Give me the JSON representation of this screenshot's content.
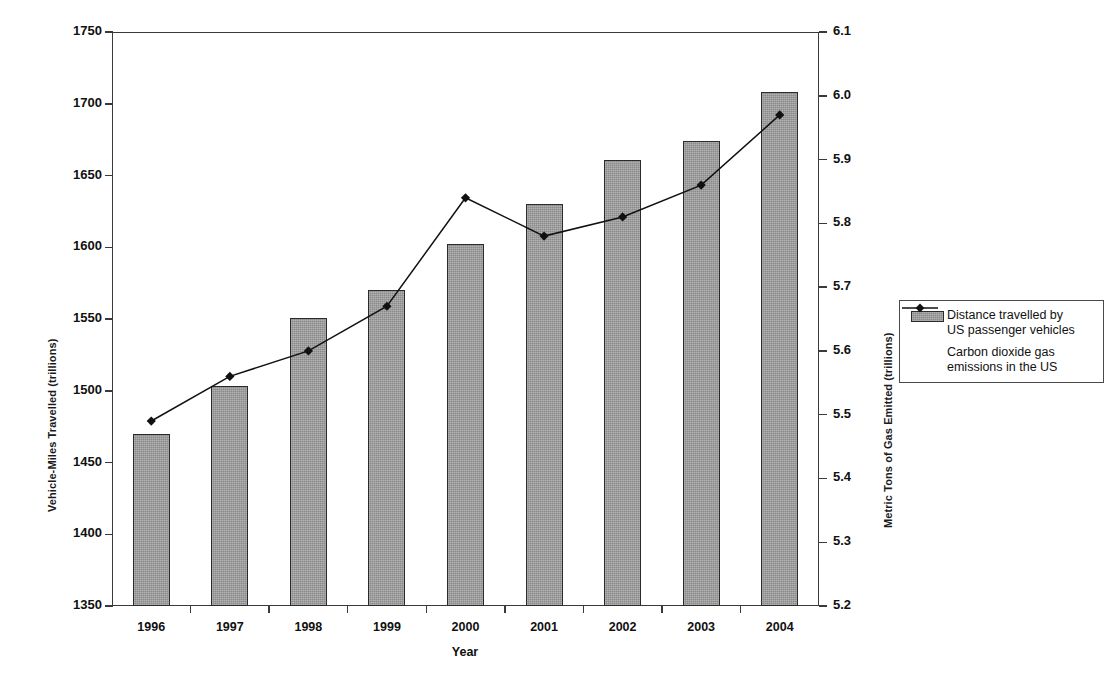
{
  "chart_data": {
    "type": "bar",
    "title": "",
    "xlabel": "Year",
    "categories": [
      "1996",
      "1997",
      "1998",
      "1999",
      "2000",
      "2001",
      "2002",
      "2003",
      "2004"
    ],
    "grid": false,
    "legend_position": "right",
    "axes": {
      "left": {
        "label": "Vehicle-Miles Travelled (trillions)",
        "min": 1350,
        "max": 1750,
        "step": 50,
        "ticks": [
          "1350",
          "1400",
          "1450",
          "1500",
          "1550",
          "1600",
          "1650",
          "1700",
          "1750"
        ]
      },
      "right": {
        "label": "Metric Tons of Gas Emitted (trillions)",
        "min": 5.2,
        "max": 6.1,
        "step": 0.1,
        "ticks": [
          "5.2",
          "5.3",
          "5.4",
          "5.5",
          "5.6",
          "5.7",
          "5.8",
          "5.9",
          "6.0",
          "6.1"
        ]
      }
    },
    "series": [
      {
        "name": "Distance travelled by US passenger vehicles",
        "legend_label_line1": "Distance travelled by",
        "legend_label_line2": "US passenger vehicles",
        "type": "bar",
        "axis": "left",
        "color": "#8a8a8a",
        "values": [
          1470,
          1503,
          1551,
          1570,
          1602,
          1630,
          1661,
          1674,
          1708
        ]
      },
      {
        "name": "Carbon dioxide gas emissions in the US",
        "legend_label_line1": "Carbon dioxide gas",
        "legend_label_line2": "emissions in the US",
        "type": "line",
        "axis": "right",
        "color": "#111111",
        "marker": "diamond",
        "values": [
          5.49,
          5.56,
          5.6,
          5.67,
          5.84,
          5.78,
          5.81,
          5.86,
          5.97
        ]
      }
    ]
  },
  "legend": {
    "bar_label_line1": "Distance travelled by",
    "bar_label_line2": "US passenger vehicles",
    "line_label_line1": "Carbon dioxide gas",
    "line_label_line2": "emissions in the US"
  }
}
